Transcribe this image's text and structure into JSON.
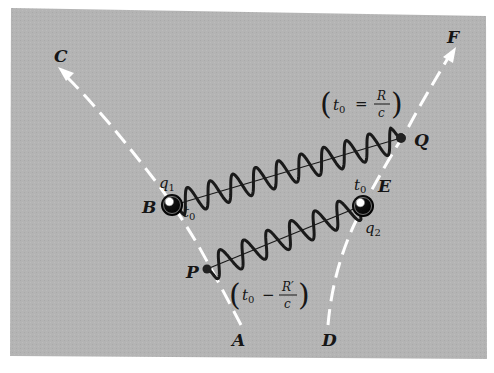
{
  "figure": {
    "background_color": "#ffffff",
    "panel_color": "#b4b4b4",
    "worldline_color": "#ffffff",
    "wave_color": "#1a1a1a",
    "label_color": "#161616"
  },
  "worldlines": [
    {
      "id": "charge-1",
      "start_label": "A",
      "end_label": "C",
      "points": {
        "start": [
          241,
          325
        ],
        "B": [
          172,
          205
        ],
        "P": [
          207,
          268
        ],
        "end": [
          62,
          72
        ]
      }
    },
    {
      "id": "charge-2",
      "start_label": "D",
      "end_label": "F",
      "points": {
        "start": [
          328,
          325
        ],
        "E": [
          363,
          207
        ],
        "Q": [
          401,
          138
        ],
        "end": [
          452,
          52
        ]
      }
    }
  ],
  "charges": [
    {
      "name": "q",
      "sub": "1",
      "at": "B"
    },
    {
      "name": "q",
      "sub": "2",
      "at": "E"
    }
  ],
  "events": [
    {
      "label": "B",
      "time_label": "t",
      "time_sub": "0"
    },
    {
      "label": "E",
      "time_label": "t",
      "time_sub": "0"
    },
    {
      "label": "P"
    },
    {
      "label": "Q"
    }
  ],
  "waves": [
    {
      "from": "B",
      "to": "Q",
      "cycles": 10
    },
    {
      "from": "P",
      "to": "E",
      "cycles": 6.5
    }
  ],
  "labels": {
    "A": "A",
    "B": "B",
    "C": "C",
    "D": "D",
    "E": "E",
    "F": "F",
    "P": "P",
    "Q": "Q",
    "q1_main": "q",
    "q1_sub": "1",
    "q2_main": "q",
    "q2_sub": "2",
    "t0_B_main": "t",
    "t0_B_sub": "0",
    "t0_E_main": "t",
    "t0_E_sub": "0"
  },
  "annotations": {
    "advanced": {
      "open": "(",
      "t": "t",
      "sub": "0",
      "op": "=",
      "num": "R",
      "den": "c",
      "close": ")"
    },
    "retarded": {
      "open": "(",
      "t": "t",
      "sub": "0",
      "op": "−",
      "num": "R′",
      "den": "c",
      "close": ")"
    }
  }
}
